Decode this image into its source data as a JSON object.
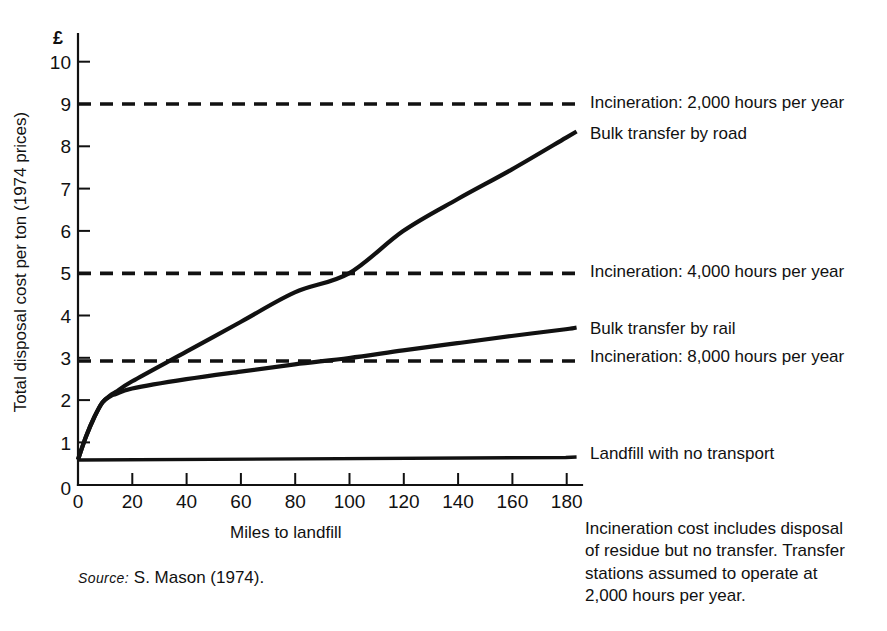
{
  "chart_data": {
    "type": "line",
    "title": "",
    "xlabel": "Miles to landfill",
    "ylabel": "Total disposal cost per ton (1974 prices)",
    "y_unit_symbol": "£",
    "xlim": [
      0,
      186
    ],
    "ylim": [
      0,
      10.6
    ],
    "grid": false,
    "legend_position": "right-inline",
    "xticks": [
      0,
      20,
      40,
      60,
      80,
      100,
      120,
      140,
      160,
      180
    ],
    "xticklabels": [
      "0",
      "20",
      "40",
      "60",
      "80",
      "100",
      "120",
      "140",
      "160",
      "180"
    ],
    "yticks": [
      0,
      1,
      2,
      3,
      4,
      5,
      6,
      7,
      8,
      9,
      10
    ],
    "yticklabels": [
      "0",
      "1",
      "2",
      "3",
      "4",
      "5",
      "6",
      "7",
      "8",
      "9",
      "10"
    ],
    "series": [
      {
        "name": "Incineration: 2,000 hours per year",
        "style": "dashed",
        "constant_value": 9.0,
        "x": [
          0,
          186
        ],
        "values": [
          9.0,
          9.0
        ]
      },
      {
        "name": "Bulk transfer by road",
        "style": "solid",
        "x": [
          0,
          3,
          6,
          9,
          12,
          14,
          20,
          40,
          60,
          80,
          100,
          120,
          140,
          160,
          180,
          184
        ],
        "values": [
          0.6,
          1.15,
          1.6,
          1.95,
          2.12,
          2.2,
          2.45,
          3.15,
          3.85,
          4.55,
          5.0,
          6.0,
          6.75,
          7.45,
          8.2,
          8.35
        ]
      },
      {
        "name": "Incineration: 4,000 hours per year",
        "style": "dashed",
        "constant_value": 5.0,
        "x": [
          0,
          186
        ],
        "values": [
          5.0,
          5.0
        ]
      },
      {
        "name": "Bulk transfer by rail",
        "style": "solid",
        "x": [
          0,
          3,
          6,
          9,
          12,
          14,
          20,
          40,
          60,
          80,
          100,
          120,
          140,
          160,
          180,
          184
        ],
        "values": [
          0.6,
          1.15,
          1.6,
          1.95,
          2.1,
          2.15,
          2.28,
          2.5,
          2.68,
          2.85,
          3.0,
          3.18,
          3.35,
          3.52,
          3.68,
          3.72
        ]
      },
      {
        "name": "Incineration: 8,000 hours per year",
        "style": "dashed",
        "constant_value": 2.93,
        "x": [
          0,
          186
        ],
        "values": [
          2.93,
          2.93
        ]
      },
      {
        "name": "Landfill with no transport",
        "style": "solid",
        "x": [
          0,
          180,
          184
        ],
        "values": [
          0.59,
          0.65,
          0.66
        ]
      }
    ],
    "annotations": [
      {
        "name": "incineration-note",
        "text": "Incineration cost includes disposal of residue but no transfer. Transfer stations assumed to operate at 2,000 hours per year.",
        "lines": [
          "Incineration cost includes disposal",
          "of residue but no transfer. Transfer",
          "stations assumed to operate at",
          "2,000 hours per year."
        ]
      }
    ]
  },
  "labels": {
    "incineration_2000": "Incineration: 2,000 hours per year",
    "bulk_road": "Bulk transfer by road",
    "incineration_4000": "Incineration: 4,000 hours per year",
    "bulk_rail": "Bulk transfer by rail",
    "incineration_8000": "Incineration: 8,000 hours per year",
    "landfill": "Landfill with no transport"
  },
  "axis": {
    "currency_symbol": "£",
    "x_title": "Miles to landfill",
    "y_title": "Total disposal cost per ton (1974 prices)"
  },
  "note": {
    "line1": "Incineration cost includes disposal",
    "line2": "of residue but no transfer. Transfer",
    "line3": "stations assumed to operate at",
    "line4": "2,000 hours per year."
  },
  "source": {
    "keyword": "Source:",
    "text": "S. Mason (1974)."
  },
  "colors": {
    "ink": "#111111",
    "background": "#ffffff"
  }
}
